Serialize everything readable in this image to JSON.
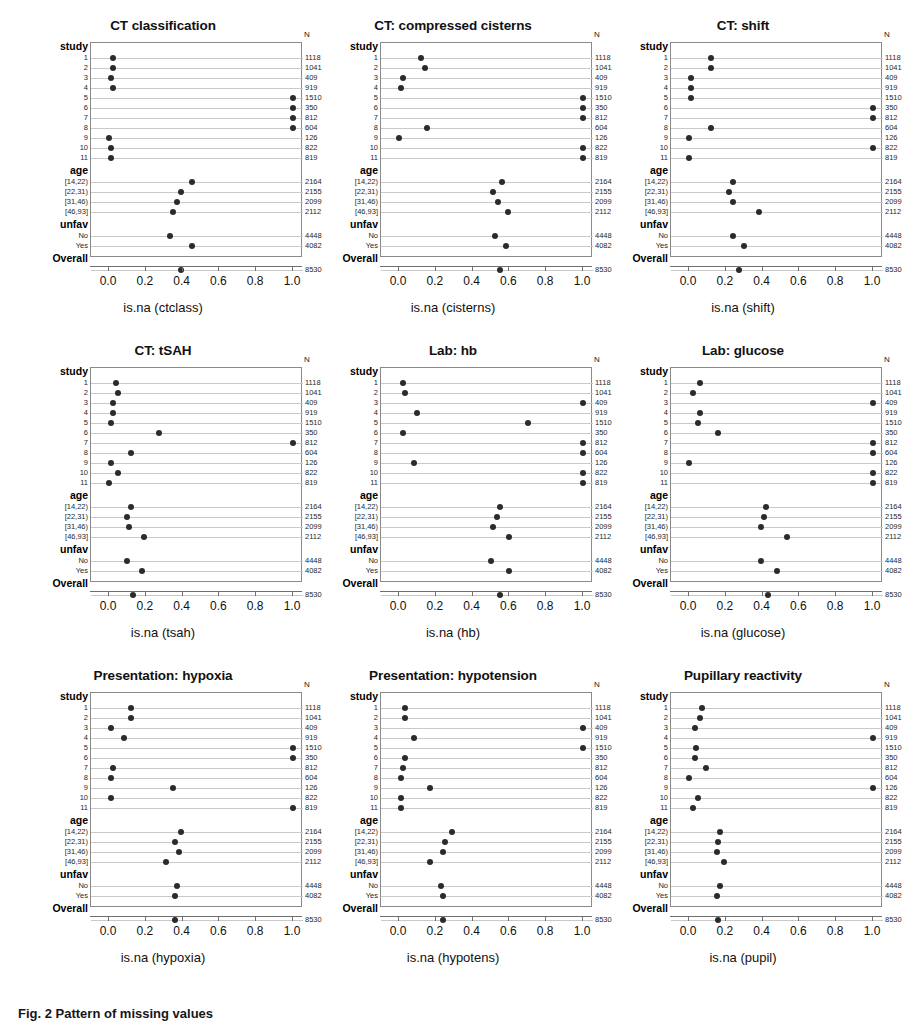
{
  "figure": {
    "caption": "Fig. 2 Pattern of missing values",
    "n_header": "N",
    "axis_ticks": [
      "0.0",
      "0.2",
      "0.4",
      "0.6",
      "0.8",
      "1.0"
    ],
    "axis_min": 0,
    "axis_max": 1,
    "dot_color": "#2b2b2b",
    "rule_color": "#c9c9c9",
    "box_color": "#8a8a8a"
  },
  "rows": [
    {
      "label": "study",
      "kind": "group",
      "n": ""
    },
    {
      "label": "1",
      "kind": "item",
      "n": "1118"
    },
    {
      "label": "2",
      "kind": "item",
      "n": "1041"
    },
    {
      "label": "3",
      "kind": "item",
      "n": "409"
    },
    {
      "label": "4",
      "kind": "item",
      "n": "919"
    },
    {
      "label": "5",
      "kind": "item",
      "n": "1510"
    },
    {
      "label": "6",
      "kind": "item",
      "n": "350"
    },
    {
      "label": "7",
      "kind": "item",
      "n": "812"
    },
    {
      "label": "8",
      "kind": "item",
      "n": "604"
    },
    {
      "label": "9",
      "kind": "item",
      "n": "126"
    },
    {
      "label": "10",
      "kind": "item",
      "n": "822"
    },
    {
      "label": "11",
      "kind": "item",
      "n": "819"
    },
    {
      "label": "age",
      "kind": "group",
      "n": ""
    },
    {
      "label": "[14,22)",
      "kind": "item",
      "n": "2164"
    },
    {
      "label": "[22,31)",
      "kind": "item",
      "n": "2155"
    },
    {
      "label": "[31,46)",
      "kind": "item",
      "n": "2099"
    },
    {
      "label": "[46,93]",
      "kind": "item",
      "n": "2112"
    },
    {
      "label": "unfav",
      "kind": "group",
      "n": ""
    },
    {
      "label": "No",
      "kind": "item",
      "n": "4448"
    },
    {
      "label": "Yes",
      "kind": "item",
      "n": "4082"
    },
    {
      "label": "Overall",
      "kind": "group",
      "n": ""
    },
    {
      "label": "",
      "kind": "item",
      "n": "8530"
    }
  ],
  "chart_data": [
    {
      "type": "scatter",
      "title": "CT classification",
      "xlabel": "is.na (ctclass)",
      "ylabel": "",
      "xlim": [
        0,
        1
      ],
      "grid": true,
      "legend": "none",
      "categories": [
        "1",
        "2",
        "3",
        "4",
        "5",
        "6",
        "7",
        "8",
        "9",
        "10",
        "11",
        "[14,22)",
        "[22,31)",
        "[31,46)",
        "[46,93]",
        "No",
        "Yes",
        "Overall"
      ],
      "values": [
        0.02,
        0.02,
        0.01,
        0.02,
        1.0,
        1.0,
        1.0,
        1.0,
        0.0,
        0.01,
        0.01,
        0.45,
        0.39,
        0.37,
        0.35,
        0.33,
        0.45,
        0.39
      ]
    },
    {
      "type": "scatter",
      "title": "CT: compressed cisterns",
      "xlabel": "is.na (cisterns)",
      "ylabel": "",
      "xlim": [
        0,
        1
      ],
      "grid": true,
      "legend": "none",
      "categories": [
        "1",
        "2",
        "3",
        "4",
        "5",
        "6",
        "7",
        "8",
        "9",
        "10",
        "11",
        "[14,22)",
        "[22,31)",
        "[31,46)",
        "[46,93]",
        "No",
        "Yes",
        "Overall"
      ],
      "values": [
        0.12,
        0.14,
        0.02,
        0.01,
        1.0,
        1.0,
        1.0,
        0.15,
        0.0,
        1.0,
        1.0,
        0.56,
        0.51,
        0.54,
        0.59,
        0.52,
        0.58,
        0.55
      ]
    },
    {
      "type": "scatter",
      "title": "CT: shift",
      "xlabel": "is.na (shift)",
      "ylabel": "",
      "xlim": [
        0,
        1
      ],
      "grid": true,
      "legend": "none",
      "categories": [
        "1",
        "2",
        "3",
        "4",
        "5",
        "6",
        "7",
        "8",
        "9",
        "10",
        "11",
        "[14,22)",
        "[22,31)",
        "[31,46)",
        "[46,93]",
        "No",
        "Yes",
        "Overall"
      ],
      "values": [
        0.12,
        0.12,
        0.01,
        0.01,
        0.01,
        1.0,
        1.0,
        0.12,
        0.0,
        1.0,
        0.0,
        0.24,
        0.22,
        0.24,
        0.38,
        0.24,
        0.3,
        0.27
      ]
    },
    {
      "type": "scatter",
      "title": "CT: tSAH",
      "xlabel": "is.na (tsah)",
      "ylabel": "",
      "xlim": [
        0,
        1
      ],
      "grid": true,
      "legend": "none",
      "categories": [
        "1",
        "2",
        "3",
        "4",
        "5",
        "6",
        "7",
        "8",
        "9",
        "10",
        "11",
        "[14,22)",
        "[22,31)",
        "[31,46)",
        "[46,93]",
        "No",
        "Yes",
        "Overall"
      ],
      "values": [
        0.04,
        0.05,
        0.02,
        0.02,
        0.01,
        0.27,
        1.0,
        0.12,
        0.01,
        0.05,
        0.0,
        0.12,
        0.1,
        0.11,
        0.19,
        0.1,
        0.18,
        0.13
      ]
    },
    {
      "type": "scatter",
      "title": "Lab: hb",
      "xlabel": "is.na (hb)",
      "ylabel": "",
      "xlim": [
        0,
        1
      ],
      "grid": true,
      "legend": "none",
      "categories": [
        "1",
        "2",
        "3",
        "4",
        "5",
        "6",
        "7",
        "8",
        "9",
        "10",
        "11",
        "[14,22)",
        "[22,31)",
        "[31,46)",
        "[46,93]",
        "No",
        "Yes",
        "Overall"
      ],
      "values": [
        0.02,
        0.03,
        1.0,
        0.1,
        0.7,
        0.02,
        1.0,
        1.0,
        0.08,
        1.0,
        1.0,
        0.55,
        0.53,
        0.51,
        0.6,
        0.5,
        0.6,
        0.55
      ]
    },
    {
      "type": "scatter",
      "title": "Lab: glucose",
      "xlabel": "is.na (glucose)",
      "ylabel": "",
      "xlim": [
        0,
        1
      ],
      "grid": true,
      "legend": "none",
      "categories": [
        "1",
        "2",
        "3",
        "4",
        "5",
        "6",
        "7",
        "8",
        "9",
        "10",
        "11",
        "[14,22)",
        "[22,31)",
        "[31,46)",
        "[46,93]",
        "No",
        "Yes",
        "Overall"
      ],
      "values": [
        0.06,
        0.02,
        1.0,
        0.06,
        0.05,
        0.16,
        1.0,
        1.0,
        0.0,
        1.0,
        1.0,
        0.42,
        0.41,
        0.39,
        0.53,
        0.39,
        0.48,
        0.43
      ]
    },
    {
      "type": "scatter",
      "title": "Presentation: hypoxia",
      "xlabel": "is.na (hypoxia)",
      "ylabel": "",
      "xlim": [
        0,
        1
      ],
      "grid": true,
      "legend": "none",
      "categories": [
        "1",
        "2",
        "3",
        "4",
        "5",
        "6",
        "7",
        "8",
        "9",
        "10",
        "11",
        "[14,22)",
        "[22,31)",
        "[31,46)",
        "[46,93]",
        "No",
        "Yes",
        "Overall"
      ],
      "values": [
        0.12,
        0.12,
        0.01,
        0.08,
        1.0,
        1.0,
        0.02,
        0.01,
        0.35,
        0.01,
        1.0,
        0.39,
        0.36,
        0.38,
        0.31,
        0.37,
        0.36,
        0.36
      ]
    },
    {
      "type": "scatter",
      "title": "Presentation: hypotension",
      "xlabel": "is.na (hypotens)",
      "ylabel": "",
      "xlim": [
        0,
        1
      ],
      "grid": true,
      "legend": "none",
      "categories": [
        "1",
        "2",
        "3",
        "4",
        "5",
        "6",
        "7",
        "8",
        "9",
        "10",
        "11",
        "[14,22)",
        "[22,31)",
        "[31,46)",
        "[46,93]",
        "No",
        "Yes",
        "Overall"
      ],
      "values": [
        0.03,
        0.03,
        1.0,
        0.08,
        1.0,
        0.03,
        0.02,
        0.01,
        0.17,
        0.01,
        0.01,
        0.29,
        0.25,
        0.24,
        0.17,
        0.23,
        0.24,
        0.24
      ]
    },
    {
      "type": "scatter",
      "title": "Pupillary reactivity",
      "xlabel": "is.na (pupil)",
      "ylabel": "",
      "xlim": [
        0,
        1
      ],
      "grid": true,
      "legend": "none",
      "categories": [
        "1",
        "2",
        "3",
        "4",
        "5",
        "6",
        "7",
        "8",
        "9",
        "10",
        "11",
        "[14,22)",
        "[22,31)",
        "[31,46)",
        "[46,93]",
        "No",
        "Yes",
        "Overall"
      ],
      "values": [
        0.07,
        0.06,
        0.03,
        1.0,
        0.04,
        0.03,
        0.09,
        0.0,
        1.0,
        0.05,
        0.02,
        0.17,
        0.16,
        0.15,
        0.19,
        0.17,
        0.15,
        0.16
      ]
    }
  ]
}
